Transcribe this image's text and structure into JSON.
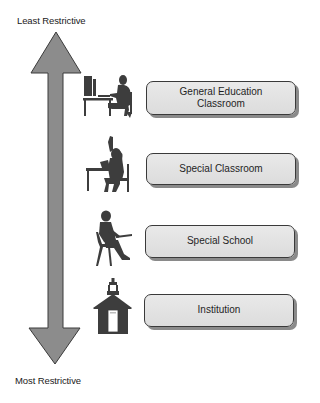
{
  "diagram": {
    "top_label": "Least Restrictive",
    "bottom_label": "Most Restrictive",
    "arrow_color": "#8c8c8c",
    "arrow_outline": "#3a3a3a",
    "levels": [
      {
        "label_line1": "General Education",
        "label_line2": "Classroom",
        "icon": "student-at-computer-icon"
      },
      {
        "label_line1": "Special Classroom",
        "label_line2": "",
        "icon": "student-raising-hand-icon"
      },
      {
        "label_line1": "Special School",
        "label_line2": "",
        "icon": "student-at-desk-icon"
      },
      {
        "label_line1": "Institution",
        "label_line2": "",
        "icon": "schoolhouse-icon"
      }
    ]
  }
}
